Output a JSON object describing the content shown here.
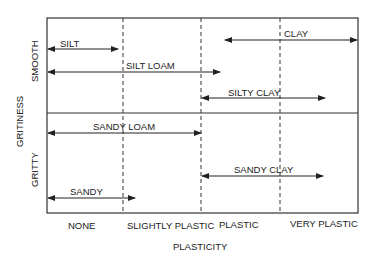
{
  "diagram": {
    "x_axis_title": "PLASTICITY",
    "y_axis_title": "GRITINESS",
    "y_regions": [
      "SMOOTH",
      "GRITTY"
    ],
    "x_categories": [
      "NONE",
      "SLIGHTLY PLASTIC",
      "PLASTIC",
      "VERY PLASTIC"
    ],
    "soil_types": [
      {
        "label": "SILT",
        "region": "SMOOTH",
        "from": "NONE",
        "to": "NONE"
      },
      {
        "label": "SILT LOAM",
        "region": "SMOOTH",
        "from": "NONE",
        "to": "PLASTIC"
      },
      {
        "label": "CLAY",
        "region": "SMOOTH",
        "from": "PLASTIC",
        "to": "VERY PLASTIC"
      },
      {
        "label": "SILTY CLAY",
        "region": "SMOOTH",
        "from": "PLASTIC",
        "to": "VERY PLASTIC"
      },
      {
        "label": "SANDY LOAM",
        "region": "GRITTY",
        "from": "NONE",
        "to": "SLIGHTLY PLASTIC"
      },
      {
        "label": "SANDY",
        "region": "GRITTY",
        "from": "NONE",
        "to": "SLIGHTLY PLASTIC"
      },
      {
        "label": "SANDY CLAY",
        "region": "GRITTY",
        "from": "PLASTIC",
        "to": "VERY PLASTIC"
      }
    ]
  }
}
